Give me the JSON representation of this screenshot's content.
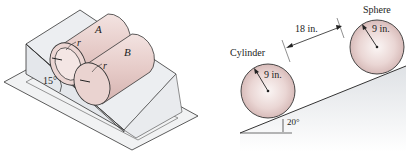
{
  "left_figure": {
    "cylinder_a_label": "A",
    "cylinder_b_label": "B",
    "radius_label_a": "r",
    "radius_label_b": "r",
    "incline_angle_label": "15°"
  },
  "right_figure": {
    "cylinder_label": "Cylinder",
    "sphere_label": "Sphere",
    "cylinder_radius_label": "9 in.",
    "sphere_radius_label": "9 in.",
    "separation_label": "18 in.",
    "incline_angle_label": "20°"
  },
  "colors": {
    "body_fill": "#e8cfcd",
    "body_highlight": "#f6ecea",
    "outline": "#333333",
    "wedge_fill": "#e3e6ea",
    "base_fill": "#f1f2f3"
  }
}
